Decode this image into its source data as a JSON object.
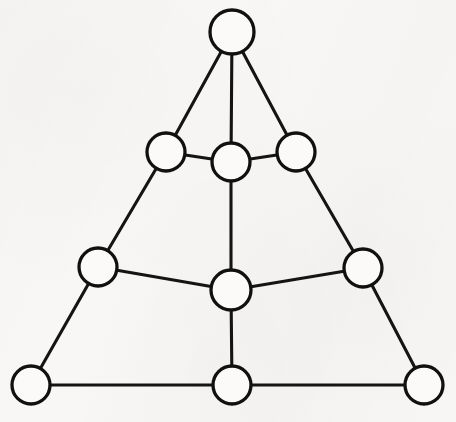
{
  "figure": {
    "caption": "",
    "background_color": "#f8f7f5",
    "stroke_color": "#141414",
    "node_fill_color": "#fbfaf8",
    "node_count": 10,
    "edge_count": 15
  },
  "chart_data": {
    "type": "diagram",
    "subtype": "node-link-graph",
    "xlabel": "",
    "ylabel": "",
    "directed": false,
    "weighted": false,
    "labeled_nodes": false,
    "node_radius_px": 19,
    "nodes": [
      {
        "id": "apex",
        "label": "",
        "x": 232,
        "y": 32,
        "r": 22,
        "degree": 3,
        "row": 1
      },
      {
        "id": "upper-left",
        "label": "",
        "x": 166,
        "y": 152,
        "r": 19,
        "degree": 3,
        "row": 2
      },
      {
        "id": "upper-center",
        "label": "",
        "x": 231,
        "y": 162,
        "r": 19,
        "degree": 4,
        "row": 2
      },
      {
        "id": "upper-right",
        "label": "",
        "x": 296,
        "y": 152,
        "r": 19,
        "degree": 3,
        "row": 2
      },
      {
        "id": "mid-left",
        "label": "",
        "x": 98,
        "y": 267,
        "r": 19,
        "degree": 3,
        "row": 3
      },
      {
        "id": "mid-center",
        "label": "",
        "x": 231,
        "y": 290,
        "r": 20,
        "degree": 4,
        "row": 3
      },
      {
        "id": "mid-right",
        "label": "",
        "x": 363,
        "y": 268,
        "r": 19,
        "degree": 3,
        "row": 3
      },
      {
        "id": "base-left",
        "label": "",
        "x": 31,
        "y": 385,
        "r": 19,
        "degree": 2,
        "row": 4
      },
      {
        "id": "base-center",
        "label": "",
        "x": 232,
        "y": 385,
        "r": 19,
        "degree": 3,
        "row": 4
      },
      {
        "id": "base-right",
        "label": "",
        "x": 424,
        "y": 385,
        "r": 19,
        "degree": 2,
        "row": 4
      }
    ],
    "edges": [
      {
        "source": "apex",
        "target": "upper-left"
      },
      {
        "source": "apex",
        "target": "upper-center"
      },
      {
        "source": "apex",
        "target": "upper-right"
      },
      {
        "source": "upper-left",
        "target": "upper-center"
      },
      {
        "source": "upper-center",
        "target": "upper-right"
      },
      {
        "source": "upper-left",
        "target": "mid-left"
      },
      {
        "source": "upper-right",
        "target": "mid-right"
      },
      {
        "source": "upper-center",
        "target": "mid-center"
      },
      {
        "source": "mid-left",
        "target": "mid-center"
      },
      {
        "source": "mid-center",
        "target": "mid-right"
      },
      {
        "source": "mid-left",
        "target": "base-left"
      },
      {
        "source": "mid-right",
        "target": "base-right"
      },
      {
        "source": "mid-center",
        "target": "base-center"
      },
      {
        "source": "base-left",
        "target": "base-center"
      },
      {
        "source": "base-center",
        "target": "base-right"
      }
    ]
  }
}
